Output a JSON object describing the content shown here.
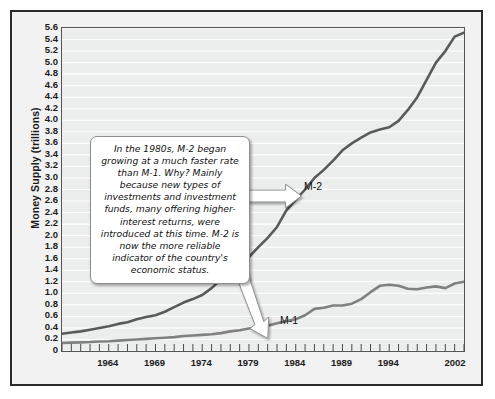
{
  "chart_data": {
    "type": "line",
    "title": "",
    "xlabel": "",
    "ylabel": "Money Supply (trillions)",
    "ylim": [
      0,
      5.6
    ],
    "xlim": [
      1959,
      2002
    ],
    "grid": true,
    "legend_position": "inline-labels",
    "ytick_labels": [
      "5.6",
      "5.4",
      "5.2",
      "5.0",
      "4.8",
      "4.6",
      "4.4",
      "4.2",
      "4.0",
      "3.8",
      "3.6",
      "3.4",
      "3.2",
      "3.0",
      "2.8",
      "2.6",
      "2.4",
      "2.2",
      "2.0",
      "1.8",
      "1.6",
      "1.4",
      "1.2",
      "1.0",
      "0.8",
      "0.6",
      "0.4",
      "0.2",
      "0"
    ],
    "ytick_values": [
      5.6,
      5.4,
      5.2,
      5.0,
      4.8,
      4.6,
      4.4,
      4.2,
      4.0,
      3.8,
      3.6,
      3.4,
      3.2,
      3.0,
      2.8,
      2.6,
      2.4,
      2.2,
      2.0,
      1.8,
      1.6,
      1.4,
      1.2,
      1.0,
      0.8,
      0.6,
      0.4,
      0.2,
      0
    ],
    "xtick_labels": [
      "1964",
      "1969",
      "1974",
      "1979",
      "1984",
      "1989",
      "1994",
      "2002"
    ],
    "xtick_values": [
      1964,
      1969,
      1974,
      1979,
      1984,
      1989,
      1994,
      2002
    ],
    "minor_xticks_every": 1,
    "series": [
      {
        "name": "M-2",
        "color": "#5a5a5a",
        "label": "M-2",
        "x": [
          1959,
          1960,
          1961,
          1962,
          1963,
          1964,
          1965,
          1966,
          1967,
          1968,
          1969,
          1970,
          1971,
          1972,
          1973,
          1974,
          1975,
          1976,
          1977,
          1978,
          1979,
          1980,
          1981,
          1982,
          1983,
          1984,
          1985,
          1986,
          1987,
          1988,
          1989,
          1990,
          1991,
          1992,
          1993,
          1994,
          1995,
          1996,
          1997,
          1998,
          1999,
          2000,
          2001,
          2002
        ],
        "values": [
          0.3,
          0.32,
          0.34,
          0.37,
          0.4,
          0.43,
          0.47,
          0.5,
          0.55,
          0.59,
          0.62,
          0.68,
          0.76,
          0.84,
          0.9,
          0.97,
          1.09,
          1.24,
          1.39,
          1.51,
          1.63,
          1.8,
          1.96,
          2.15,
          2.44,
          2.62,
          2.8,
          3.0,
          3.14,
          3.3,
          3.48,
          3.6,
          3.7,
          3.79,
          3.84,
          3.88,
          3.99,
          4.18,
          4.4,
          4.7,
          5.0,
          5.2,
          5.45,
          5.52
        ]
      },
      {
        "name": "M-1",
        "color": "#808080",
        "label": "M-1",
        "x": [
          1959,
          1960,
          1961,
          1962,
          1963,
          1964,
          1965,
          1966,
          1967,
          1968,
          1969,
          1970,
          1971,
          1972,
          1973,
          1974,
          1975,
          1976,
          1977,
          1978,
          1979,
          1980,
          1981,
          1982,
          1983,
          1984,
          1985,
          1986,
          1987,
          1988,
          1989,
          1990,
          1991,
          1992,
          1993,
          1994,
          1995,
          1996,
          1997,
          1998,
          1999,
          2000,
          2001,
          2002
        ],
        "values": [
          0.14,
          0.145,
          0.15,
          0.155,
          0.165,
          0.17,
          0.18,
          0.19,
          0.2,
          0.21,
          0.22,
          0.23,
          0.24,
          0.26,
          0.27,
          0.28,
          0.29,
          0.31,
          0.34,
          0.36,
          0.39,
          0.41,
          0.44,
          0.48,
          0.52,
          0.55,
          0.62,
          0.73,
          0.75,
          0.79,
          0.79,
          0.82,
          0.9,
          1.02,
          1.13,
          1.15,
          1.13,
          1.08,
          1.07,
          1.1,
          1.12,
          1.09,
          1.17,
          1.2
        ]
      }
    ],
    "annotations": [
      {
        "name": "callout",
        "text": "In the 1980s, M-2 began growing at a much faster rate than M-1. Why? Mainly because new types of investments and investment funds, many offering higher-interest returns, were introduced at this time. M-2 is now the more reliable indicator of the country's economic status.",
        "points_to": [
          "M-2",
          "M-1"
        ]
      }
    ]
  },
  "figure": {
    "background": "#f2f2f2",
    "plot_background": "#eceded",
    "border_color": "#2b2b2b",
    "gridline_color": "#ffffff"
  }
}
